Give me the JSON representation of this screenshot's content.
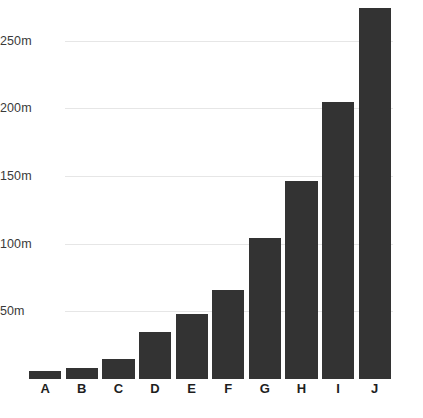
{
  "chart_data": {
    "type": "bar",
    "title": "",
    "subtitle": "",
    "xlabel": "",
    "ylabel": "",
    "categories": [
      "A",
      "B",
      "C",
      "D",
      "E",
      "F",
      "G",
      "H",
      "I",
      "J"
    ],
    "values": [
      6,
      8,
      15,
      35,
      48,
      66,
      104,
      146,
      205,
      274
    ],
    "value_suffix": "m",
    "ylim": [
      0,
      280
    ],
    "yticks": [
      50,
      100,
      150,
      200,
      250
    ],
    "ytick_labels": [
      "50m",
      "100m",
      "150m",
      "200m",
      "250m"
    ],
    "grid": true,
    "grid_axis": "y",
    "legend": null,
    "legend_position": "none",
    "bar_color": "#333333",
    "gridline_color": "#e6e6e6",
    "background_color": "#ffffff",
    "tick_label_color": "#3a3a3a",
    "category_label_color": "#1e1e1e",
    "series": [
      {
        "name": "",
        "values": [
          6,
          8,
          15,
          35,
          48,
          66,
          104,
          146,
          205,
          274
        ]
      }
    ]
  }
}
